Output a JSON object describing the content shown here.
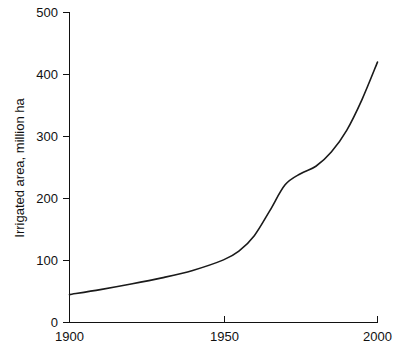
{
  "chart_data": {
    "type": "line",
    "title": "",
    "subtitle": "",
    "xlabel": "",
    "ylabel": "Irrigated area, million ha",
    "xlim": [
      1900,
      2000
    ],
    "ylim": [
      0,
      500
    ],
    "grid": false,
    "legend": false,
    "legend_position": "none",
    "background_color": "#ffffff",
    "line_color": "#1a1a1a",
    "axis_color": "#111111",
    "x_ticks": [
      1900,
      1950,
      2000
    ],
    "x_tick_labels": [
      "1900",
      "1950",
      "2000"
    ],
    "y_ticks": [
      0,
      100,
      200,
      300,
      400,
      500
    ],
    "y_tick_labels": [
      "0",
      "100",
      "200",
      "300",
      "400",
      "500"
    ],
    "series": [
      {
        "name": "Irrigated area",
        "x": [
          1900,
          1910,
          1920,
          1930,
          1940,
          1950,
          1955,
          1960,
          1965,
          1970,
          1975,
          1980,
          1985,
          1990,
          1995,
          2000
        ],
        "values": [
          45,
          53,
          62,
          72,
          84,
          101,
          115,
          140,
          180,
          222,
          240,
          252,
          275,
          310,
          360,
          420
        ]
      }
    ],
    "annotations": []
  },
  "axes": {
    "y_title": "Irrigated area, million ha",
    "y_labels": {
      "t0": "0",
      "t100": "100",
      "t200": "200",
      "t300": "300",
      "t400": "400",
      "t500": "500"
    },
    "x_labels": {
      "t1900": "1900",
      "t1950": "1950",
      "t2000": "2000"
    }
  }
}
